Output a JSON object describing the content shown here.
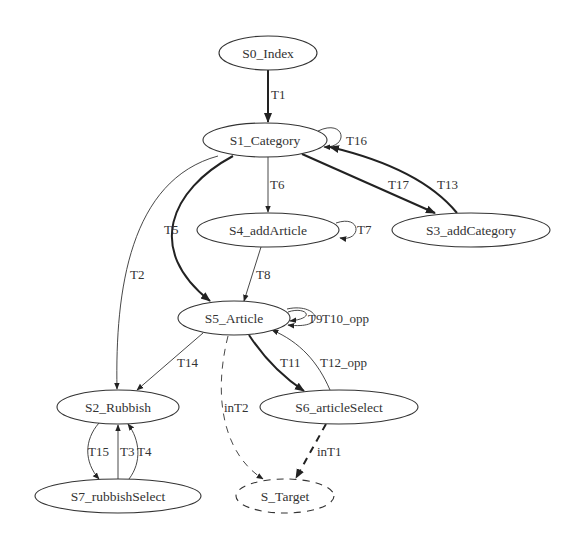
{
  "diagram": {
    "type": "state-transition-graph",
    "nodes": [
      {
        "id": "S0",
        "label": "S0_Index",
        "cx": 268,
        "cy": 53,
        "rx": 49,
        "ry": 17,
        "style": "solid"
      },
      {
        "id": "S1",
        "label": "S1_Category",
        "cx": 265,
        "cy": 140,
        "rx": 62,
        "ry": 17,
        "style": "solid"
      },
      {
        "id": "S4",
        "label": "S4_addArticle",
        "cx": 268,
        "cy": 230,
        "rx": 71,
        "ry": 17,
        "style": "solid"
      },
      {
        "id": "S3",
        "label": "S3_addCategory",
        "cx": 471,
        "cy": 230,
        "rx": 79,
        "ry": 17,
        "style": "solid"
      },
      {
        "id": "S5",
        "label": "S5_Article",
        "cx": 234,
        "cy": 318,
        "rx": 56,
        "ry": 17,
        "style": "solid"
      },
      {
        "id": "S2",
        "label": "S2_Rubbish",
        "cx": 118,
        "cy": 407,
        "rx": 61,
        "ry": 17,
        "style": "solid"
      },
      {
        "id": "S6",
        "label": "S6_articleSelect",
        "cx": 339,
        "cy": 407,
        "rx": 79,
        "ry": 17,
        "style": "solid"
      },
      {
        "id": "S7",
        "label": "S7_rubbishSelect",
        "cx": 118,
        "cy": 496,
        "rx": 83,
        "ry": 17,
        "style": "solid"
      },
      {
        "id": "ST",
        "label": "S_Target",
        "cx": 285,
        "cy": 496,
        "rx": 49,
        "ry": 17,
        "style": "dashed"
      }
    ],
    "edges": [
      {
        "label": "T1",
        "from": "S0",
        "to": "S1",
        "weight": "bold"
      },
      {
        "label": "T16",
        "from": "S1",
        "to": "S1",
        "weight": "normal"
      },
      {
        "label": "T6",
        "from": "S1",
        "to": "S4",
        "weight": "normal"
      },
      {
        "label": "T17",
        "from": "S1",
        "to": "S3",
        "weight": "bold"
      },
      {
        "label": "T13",
        "from": "S3",
        "to": "S1",
        "weight": "bold"
      },
      {
        "label": "T5",
        "from": "S1",
        "to": "S5",
        "weight": "bold"
      },
      {
        "label": "T2",
        "from": "S1",
        "to": "S2",
        "weight": "normal"
      },
      {
        "label": "T7",
        "from": "S4",
        "to": "S4",
        "weight": "normal"
      },
      {
        "label": "T8",
        "from": "S4",
        "to": "S5",
        "weight": "normal"
      },
      {
        "label": "T9",
        "from": "S5",
        "to": "S5",
        "weight": "normal"
      },
      {
        "label": "T10_opp",
        "from": "S5",
        "to": "S5",
        "weight": "normal"
      },
      {
        "label": "T14",
        "from": "S5",
        "to": "S2",
        "weight": "normal"
      },
      {
        "label": "T11",
        "from": "S5",
        "to": "S6",
        "weight": "bold"
      },
      {
        "label": "T12_opp",
        "from": "S6",
        "to": "S5",
        "weight": "normal"
      },
      {
        "label": "inT2",
        "from": "S5",
        "to": "ST",
        "weight": "dashed"
      },
      {
        "label": "inT1",
        "from": "S6",
        "to": "ST",
        "weight": "bold-dashed"
      },
      {
        "label": "T15",
        "from": "S2",
        "to": "S7",
        "weight": "normal"
      },
      {
        "label": "T3",
        "from": "S7",
        "to": "S2",
        "weight": "normal"
      },
      {
        "label": "T4",
        "from": "S7",
        "to": "S2",
        "weight": "normal"
      }
    ]
  },
  "labels": {
    "S0": "S0_Index",
    "S1": "S1_Category",
    "S2": "S2_Rubbish",
    "S3": "S3_addCategory",
    "S4": "S4_addArticle",
    "S5": "S5_Article",
    "S6": "S6_articleSelect",
    "S7": "S7_rubbishSelect",
    "ST": "S_Target",
    "T1": "T1",
    "T2": "T2",
    "T3": "T3",
    "T4": "T4",
    "T5": "T5",
    "T6": "T6",
    "T7": "T7",
    "T8": "T8",
    "T9": "T9",
    "T10": "T10_opp",
    "T11": "T11",
    "T12": "T12_opp",
    "T13": "T13",
    "T14": "T14",
    "T15": "T15",
    "T16": "T16",
    "T17": "T17",
    "inT1": "inT1",
    "inT2": "inT2"
  },
  "colors": {
    "background": "#ffffff",
    "stroke": "#333333",
    "text": "#333333"
  }
}
